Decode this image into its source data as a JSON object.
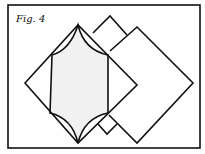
{
  "figure": {
    "caption": "Fig. 4",
    "colors": {
      "line": "#111111",
      "shaded": "#f1f1f1",
      "background": "#ffffff"
    }
  }
}
